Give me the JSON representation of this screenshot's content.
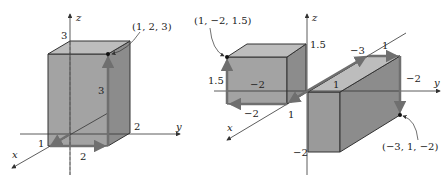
{
  "left_figure": {
    "point_label": "(1, 2, 3)",
    "axis_x": "x",
    "axis_y": "y",
    "axis_z": "z",
    "tick_z": "3",
    "tick_y": "2",
    "tick_x": "1",
    "edge_x": "2",
    "edge_height": "3"
  },
  "right_figure": {
    "point_a_label": "(1, −2, 1.5)",
    "point_b_label": "(−3, 1, −2)",
    "axis_x": "x",
    "axis_y": "y",
    "axis_z": "z",
    "box_a": {
      "tick_z": "1.5",
      "height_label": "1.5",
      "inner_label": "−2",
      "bottom_label": "−2",
      "x_label": "1"
    },
    "box_b": {
      "top_label": "−3",
      "y_label": "1",
      "near_label": "1",
      "side_label": "−2",
      "z_label": "−2"
    }
  },
  "colors": {
    "box_fill": "#9a9a9a",
    "box_top": "#bdbdbd",
    "arrow": "#6f6f6f",
    "line": "#333333"
  }
}
